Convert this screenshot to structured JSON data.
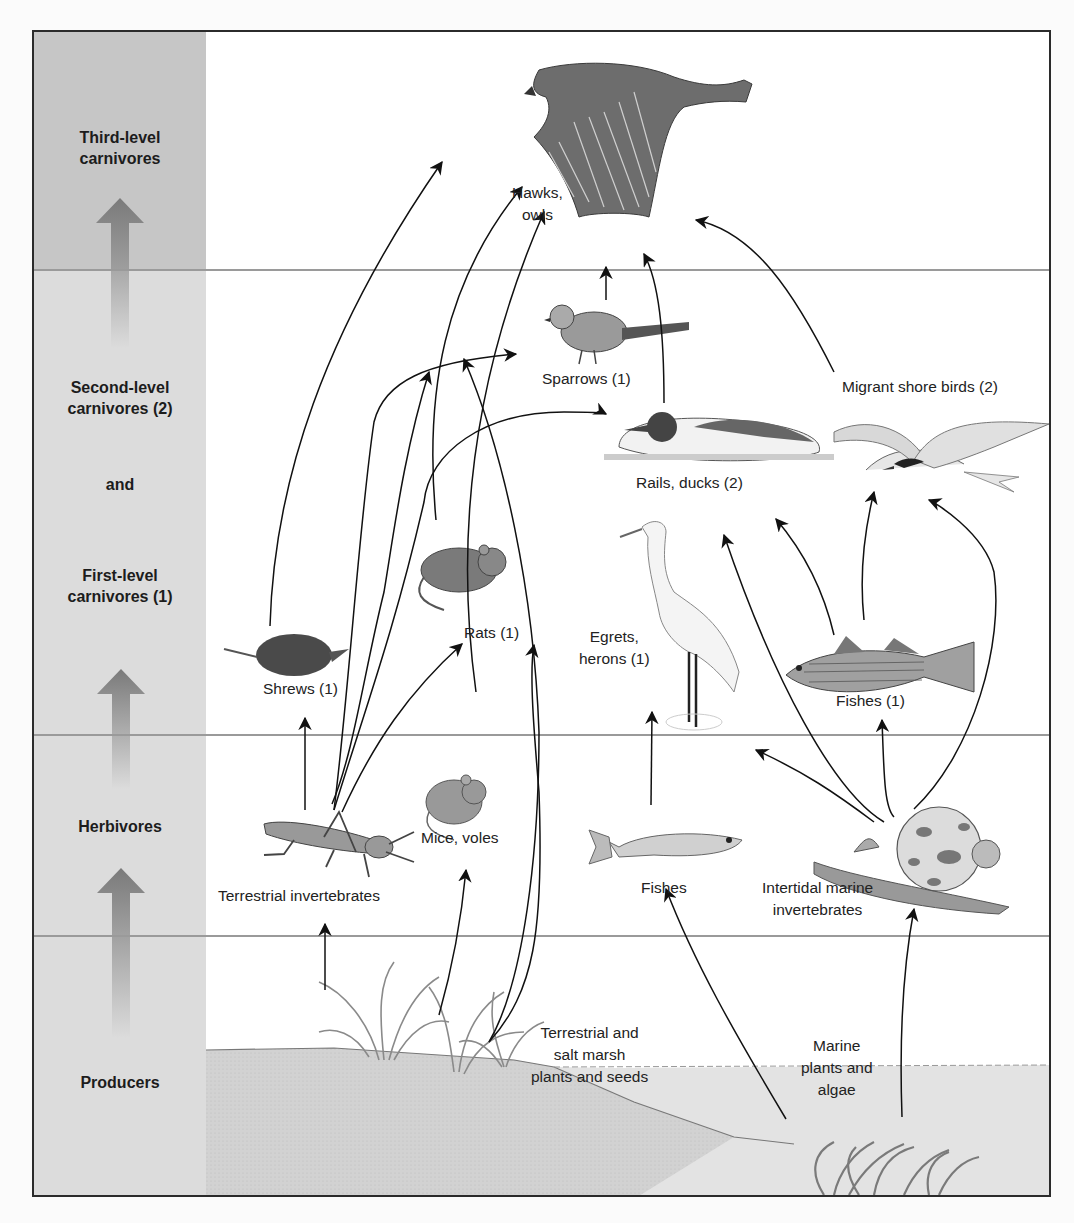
{
  "diagram": {
    "type": "food-web",
    "trophic_levels": [
      {
        "id": "third",
        "label_line1": "Third-level",
        "label_line2": "carnivores"
      },
      {
        "id": "second_first",
        "label_line1": "Second-level",
        "label_line2": "carnivores (2)",
        "connector": "and",
        "label_line3": "First-level",
        "label_line4": "carnivores (1)"
      },
      {
        "id": "herbivores",
        "label_line1": "Herbivores"
      },
      {
        "id": "producers",
        "label_line1": "Producers"
      }
    ],
    "nodes": {
      "hawks": {
        "line1": "Hawks,",
        "line2": "owls",
        "level": "third"
      },
      "sparrows": {
        "line1": "Sparrows (1)",
        "level": "first"
      },
      "migrant_shore_birds": {
        "line1": "Migrant shore birds (2)",
        "level": "second"
      },
      "rails_ducks": {
        "line1": "Rails, ducks (2)",
        "level": "second"
      },
      "rats": {
        "line1": "Rats (1)",
        "level": "first"
      },
      "shrews": {
        "line1": "Shrews (1)",
        "level": "first"
      },
      "egrets": {
        "line1": "Egrets,",
        "line2": "herons (1)",
        "level": "first"
      },
      "fishes1": {
        "line1": "Fishes (1)",
        "level": "first"
      },
      "terrestrial_invertebrates": {
        "line1": "Terrestrial invertebrates",
        "level": "herbivore"
      },
      "mice_voles": {
        "line1": "Mice, voles",
        "level": "herbivore"
      },
      "fishes": {
        "line1": "Fishes",
        "level": "herbivore"
      },
      "intertidal": {
        "line1": "Intertidal marine",
        "line2": "invertebrates",
        "level": "herbivore"
      },
      "terrestrial_plants": {
        "line1": "Terrestrial and",
        "line2": "salt marsh",
        "line3": "plants and seeds",
        "level": "producer"
      },
      "marine_plants": {
        "line1": "Marine",
        "line2": "plants and",
        "line3": "algae",
        "level": "producer"
      }
    },
    "edges": [
      [
        "terrestrial_plants",
        "terrestrial_invertebrates"
      ],
      [
        "terrestrial_plants",
        "mice_voles"
      ],
      [
        "terrestrial_plants",
        "rats"
      ],
      [
        "terrestrial_plants",
        "sparrows"
      ],
      [
        "terrestrial_plants",
        "rails_ducks"
      ],
      [
        "marine_plants",
        "fishes"
      ],
      [
        "marine_plants",
        "intertidal"
      ],
      [
        "terrestrial_invertebrates",
        "shrews"
      ],
      [
        "terrestrial_invertebrates",
        "rats"
      ],
      [
        "terrestrial_invertebrates",
        "sparrows"
      ],
      [
        "terrestrial_invertebrates",
        "rails_ducks"
      ],
      [
        "terrestrial_invertebrates",
        "hawks"
      ],
      [
        "mice_voles",
        "hawks"
      ],
      [
        "shrews",
        "hawks"
      ],
      [
        "rats",
        "hawks"
      ],
      [
        "sparrows",
        "hawks"
      ],
      [
        "rails_ducks",
        "hawks"
      ],
      [
        "migrant_shore_birds",
        "hawks"
      ],
      [
        "fishes",
        "egrets"
      ],
      [
        "intertidal",
        "fishes1"
      ],
      [
        "intertidal",
        "egrets"
      ],
      [
        "intertidal",
        "rails_ducks"
      ],
      [
        "intertidal",
        "migrant_shore_birds"
      ],
      [
        "fishes1",
        "rails_ducks"
      ],
      [
        "fishes1",
        "migrant_shore_birds"
      ]
    ],
    "colors": {
      "frame": "#2b2b2b",
      "sidebar_top": "#c6c6c6",
      "sidebar": "#dcdcdc",
      "divider": "#9a9a9a",
      "arrow": "#111111",
      "ground": "#d4d4d4",
      "water": "#e2e2e2"
    }
  }
}
